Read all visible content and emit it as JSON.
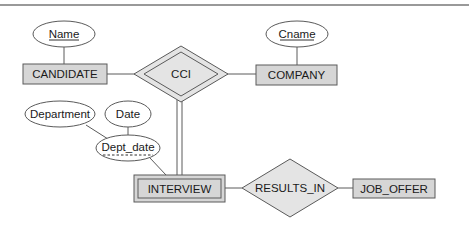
{
  "diagram": {
    "type": "ER diagram",
    "colors": {
      "entity_fill": "#d6d6d6",
      "relationship_fill": "#e4e4e4",
      "stroke": "#5a5a5a",
      "rule": "#777777",
      "text": "#1a1a1a"
    },
    "entities": [
      {
        "id": "candidate",
        "label": "CANDIDATE",
        "weak": false
      },
      {
        "id": "company",
        "label": "COMPANY",
        "weak": false
      },
      {
        "id": "interview",
        "label": "INTERVIEW",
        "weak": true
      },
      {
        "id": "job_offer",
        "label": "JOB_OFFER",
        "weak": false
      }
    ],
    "relationships": [
      {
        "id": "cci",
        "label": "CCI",
        "identifying": true
      },
      {
        "id": "results_in",
        "label": "RESULTS_IN",
        "identifying": false
      }
    ],
    "attributes": [
      {
        "id": "name",
        "label": "Name",
        "owner": "CANDIDATE",
        "key": "key"
      },
      {
        "id": "cname",
        "label": "Cname",
        "owner": "COMPANY",
        "key": "key"
      },
      {
        "id": "dept_date",
        "label": "Dept_date",
        "owner": "INTERVIEW",
        "key": "partial"
      },
      {
        "id": "department",
        "label": "Department",
        "owner": "Dept_date",
        "key": "none"
      },
      {
        "id": "date",
        "label": "Date",
        "owner": "Dept_date",
        "key": "none"
      }
    ],
    "connections": [
      {
        "from": "CANDIDATE",
        "to": "CCI",
        "participation": "partial"
      },
      {
        "from": "COMPANY",
        "to": "CCI",
        "participation": "partial"
      },
      {
        "from": "INTERVIEW",
        "to": "CCI",
        "participation": "total"
      },
      {
        "from": "INTERVIEW",
        "to": "RESULTS_IN",
        "participation": "partial"
      },
      {
        "from": "RESULTS_IN",
        "to": "JOB_OFFER",
        "participation": "partial"
      }
    ]
  }
}
